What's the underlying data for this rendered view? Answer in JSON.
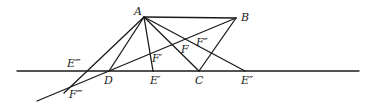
{
  "diagram": {
    "type": "geometric construction",
    "points": {
      "A": {
        "label": "A",
        "x": 144,
        "y": 17
      },
      "B": {
        "label": "B",
        "x": 236,
        "y": 18
      },
      "C": {
        "label": "C",
        "x": 199,
        "y": 71
      },
      "D": {
        "label": "D",
        "x": 109,
        "y": 71
      },
      "E1": {
        "label": "E′",
        "x": 153,
        "y": 71
      },
      "E2": {
        "label": "E″",
        "x": 245,
        "y": 71
      },
      "E3": {
        "label": "E‴",
        "x": 87,
        "y": 71
      },
      "F": {
        "label": "F",
        "x": 170,
        "y": 52
      },
      "F1": {
        "label": "F′",
        "x": 151,
        "y": 60
      },
      "F2": {
        "label": "F″",
        "x": 199,
        "y": 39
      },
      "F3": {
        "label": "F‴",
        "x": 69,
        "y": 88
      }
    },
    "labels": [
      "A",
      "B",
      "C",
      "D",
      "E′",
      "E″",
      "E‴",
      "F",
      "F′",
      "F″",
      "F‴"
    ],
    "segments": [
      [
        "A",
        "B"
      ],
      [
        "A",
        "D"
      ],
      [
        "A",
        "E′"
      ],
      [
        "A",
        "C"
      ],
      [
        "A",
        "E″"
      ],
      [
        "A",
        "F‴"
      ],
      [
        "B",
        "C"
      ],
      [
        "B",
        "F‴ (extended)"
      ],
      [
        "baseline"
      ]
    ]
  }
}
